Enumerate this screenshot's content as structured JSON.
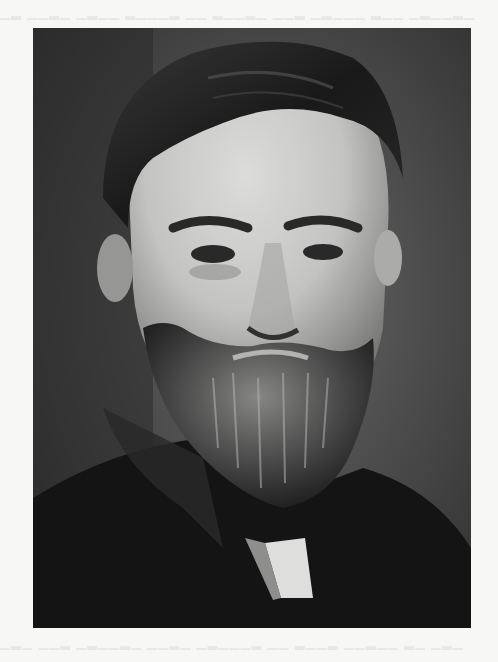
{
  "page": {
    "background_color": "#f7f7f5",
    "show_through_text_visible": true
  },
  "photo": {
    "subject": "black-and-white head-and-shoulders portrait of a bearded man",
    "style": "halftone grayscale print",
    "frame": {
      "x": 33,
      "y": 28,
      "width": 438,
      "height": 600
    },
    "colors": {
      "background_dark": "#2e2e2e",
      "background_mid": "#5a5a5a",
      "skin_light": "#d8d8d6",
      "skin_shadow": "#8a8a88",
      "hair": "#1c1c1c",
      "beard": "#4a4a4a",
      "beard_highlight": "#a8a8a6",
      "coat": "#151515",
      "collar": "#e4e4e2"
    }
  }
}
